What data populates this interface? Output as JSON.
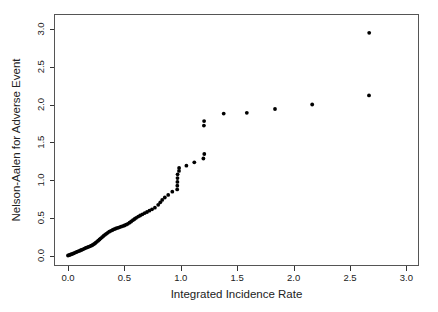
{
  "figure": {
    "background": "#ffffff",
    "frame_color": "#555555",
    "tick_color": "#333333",
    "text_color": "#222222"
  },
  "chart_data": {
    "type": "scatter",
    "title": "",
    "xlabel": "Integrated Incidence Rate",
    "ylabel": "Nelson-Aalen for Adverse Event",
    "xlim": [
      0,
      3
    ],
    "ylim": [
      0,
      3
    ],
    "grid": false,
    "legend": "none",
    "marker": {
      "shape": "filled-circle",
      "color": "#000000",
      "radius": 1.9
    },
    "x_ticks": [
      0.0,
      0.5,
      1.0,
      1.5,
      2.0,
      2.5,
      3.0
    ],
    "y_ticks": [
      0.0,
      0.5,
      1.0,
      1.5,
      2.0,
      2.5,
      3.0
    ],
    "x_tick_labels": [
      "0.0",
      "0.5",
      "1.0",
      "1.5",
      "2.0",
      "2.5",
      "3.0"
    ],
    "y_tick_labels": [
      "0.0",
      "0.5",
      "1.0",
      "1.5",
      "2.0",
      "2.5",
      "3.0"
    ],
    "points": [
      [
        0.0,
        0.0
      ],
      [
        0.012,
        0.006
      ],
      [
        0.024,
        0.013
      ],
      [
        0.036,
        0.02
      ],
      [
        0.048,
        0.028
      ],
      [
        0.06,
        0.036
      ],
      [
        0.072,
        0.044
      ],
      [
        0.084,
        0.051
      ],
      [
        0.096,
        0.058
      ],
      [
        0.108,
        0.066
      ],
      [
        0.12,
        0.074
      ],
      [
        0.132,
        0.082
      ],
      [
        0.145,
        0.091
      ],
      [
        0.158,
        0.1
      ],
      [
        0.17,
        0.108
      ],
      [
        0.182,
        0.115
      ],
      [
        0.194,
        0.122
      ],
      [
        0.206,
        0.13
      ],
      [
        0.218,
        0.139
      ],
      [
        0.231,
        0.152
      ],
      [
        0.243,
        0.166
      ],
      [
        0.255,
        0.181
      ],
      [
        0.267,
        0.196
      ],
      [
        0.279,
        0.212
      ],
      [
        0.291,
        0.228
      ],
      [
        0.303,
        0.244
      ],
      [
        0.315,
        0.259
      ],
      [
        0.327,
        0.274
      ],
      [
        0.339,
        0.288
      ],
      [
        0.351,
        0.301
      ],
      [
        0.365,
        0.315
      ],
      [
        0.38,
        0.327
      ],
      [
        0.395,
        0.338
      ],
      [
        0.41,
        0.348
      ],
      [
        0.425,
        0.357
      ],
      [
        0.44,
        0.366
      ],
      [
        0.455,
        0.374
      ],
      [
        0.47,
        0.382
      ],
      [
        0.485,
        0.39
      ],
      [
        0.5,
        0.398
      ],
      [
        0.515,
        0.408
      ],
      [
        0.53,
        0.42
      ],
      [
        0.545,
        0.434
      ],
      [
        0.56,
        0.45
      ],
      [
        0.575,
        0.467
      ],
      [
        0.59,
        0.484
      ],
      [
        0.605,
        0.5
      ],
      [
        0.622,
        0.515
      ],
      [
        0.64,
        0.53
      ],
      [
        0.66,
        0.546
      ],
      [
        0.68,
        0.561
      ],
      [
        0.7,
        0.576
      ],
      [
        0.722,
        0.593
      ],
      [
        0.745,
        0.612
      ],
      [
        0.77,
        0.633
      ],
      [
        0.8,
        0.672
      ],
      [
        0.818,
        0.705
      ],
      [
        0.835,
        0.737
      ],
      [
        0.858,
        0.768
      ],
      [
        0.888,
        0.803
      ],
      [
        0.925,
        0.845
      ],
      [
        0.968,
        0.875
      ],
      [
        0.969,
        0.925
      ],
      [
        0.97,
        0.975
      ],
      [
        0.971,
        1.025
      ],
      [
        0.972,
        1.075
      ],
      [
        0.984,
        1.12
      ],
      [
        0.985,
        1.16
      ],
      [
        1.05,
        1.19
      ],
      [
        1.12,
        1.235
      ],
      [
        1.2,
        1.285
      ],
      [
        1.208,
        1.345
      ],
      [
        1.205,
        1.72
      ],
      [
        1.207,
        1.78
      ],
      [
        1.38,
        1.88
      ],
      [
        1.585,
        1.89
      ],
      [
        1.835,
        1.94
      ],
      [
        2.165,
        2.0
      ],
      [
        2.668,
        2.12
      ],
      [
        2.67,
        2.95
      ]
    ]
  }
}
